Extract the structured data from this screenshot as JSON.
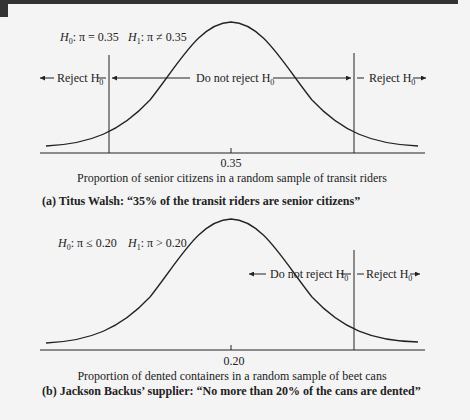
{
  "panel_a": {
    "hypotheses": {
      "h0_prefix": "H",
      "h0_sub": "0",
      "h0_rest": ": π = 0.35",
      "h1_prefix": "H",
      "h1_sub": "1",
      "h1_rest": ": π ≠ 0.35"
    },
    "regions": {
      "left_reject": "Reject H",
      "middle": "Do not reject H",
      "right_reject": "Reject H",
      "subscript": "0"
    },
    "tick_label": "0.35",
    "axis_label": "Proportion of senior citizens in a random sample of transit riders",
    "caption": "(a) Titus Walsh: “35% of the transit riders are senior citizens”"
  },
  "panel_b": {
    "hypotheses": {
      "h0_prefix": "H",
      "h0_sub": "0",
      "h0_rest": ": π ≤ 0.20",
      "h1_prefix": "H",
      "h1_sub": "1",
      "h1_rest": ": π > 0.20"
    },
    "regions": {
      "middle": "Do not reject H",
      "right_reject": "Reject H",
      "subscript": "0"
    },
    "tick_label": "0.20",
    "axis_label": "Proportion of dented containers in a random sample of beet cans",
    "caption": "(b) Jackson Backus’ supplier: “No more than 20% of the cans are dented”"
  },
  "colors": {
    "ink": "#222222",
    "background": "#f4f4f4",
    "topbar": "#333333"
  }
}
